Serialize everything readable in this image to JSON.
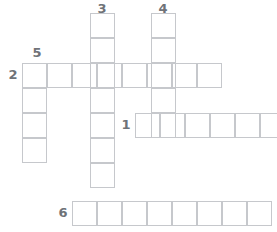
{
  "puzzle": {
    "title_clipped": "",
    "cell_size": 25,
    "grid_color": "#c6c8cc",
    "number_color": "#6f7378",
    "background": "#ffffff",
    "numbers": [
      {
        "label": "3",
        "x": 94,
        "y": 2
      },
      {
        "label": "4",
        "x": 155,
        "y": 2
      },
      {
        "label": "5",
        "x": 29,
        "y": 46
      },
      {
        "label": "2",
        "x": 5,
        "y": 68
      },
      {
        "label": "1",
        "x": 118,
        "y": 118
      },
      {
        "label": "6",
        "x": 55,
        "y": 206
      }
    ],
    "entries": [
      {
        "name": "entry-3-down",
        "number": "3",
        "direction": "down",
        "length": 7,
        "x": 90,
        "y": 13
      },
      {
        "name": "entry-4-down",
        "number": "4",
        "direction": "down",
        "length": 5,
        "x": 151,
        "y": 13
      },
      {
        "name": "entry-5-down",
        "number": "5",
        "direction": "down",
        "length": 4,
        "x": 22,
        "y": 63
      },
      {
        "name": "entry-2-across",
        "number": "2",
        "direction": "across",
        "length": 8,
        "x": 22,
        "y": 63
      },
      {
        "name": "entry-1-across",
        "number": "1",
        "direction": "across",
        "length": 6,
        "x": 135,
        "y": 113
      },
      {
        "name": "entry-6-across",
        "number": "6",
        "direction": "across",
        "length": 8,
        "x": 72,
        "y": 201
      }
    ]
  }
}
